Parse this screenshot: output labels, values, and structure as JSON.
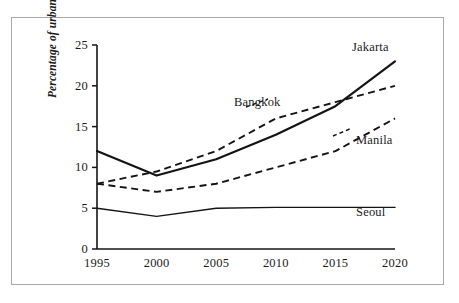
{
  "chart_data": {
    "type": "line",
    "title": "",
    "xlabel": "",
    "ylabel": "Percentage of urban income",
    "x": [
      1995,
      2000,
      2005,
      2010,
      2015,
      2020
    ],
    "categories": [
      "1995",
      "2000",
      "2005",
      "2010",
      "2015",
      "2020"
    ],
    "xlim": [
      1995,
      2020
    ],
    "ylim": [
      0,
      25
    ],
    "yticks": [
      0,
      5,
      10,
      15,
      20,
      25
    ],
    "ytick_labels": [
      "0",
      "5",
      "10",
      "15",
      "20",
      "25"
    ],
    "xticks": [
      1995,
      2000,
      2005,
      2010,
      2015,
      2020
    ],
    "xtick_labels": [
      "1995",
      "2000",
      "2005",
      "2010",
      "2015",
      "2020"
    ],
    "grid": false,
    "legend_position": "inline-labels",
    "series": [
      {
        "name": "Jakarta",
        "style": "solid",
        "width": 2.2,
        "color": "#141414",
        "values": [
          12.0,
          9.0,
          11.0,
          14.0,
          17.5,
          23.0
        ]
      },
      {
        "name": "Bangkok",
        "style": "dashed",
        "width": 1.9,
        "color": "#141414",
        "values": [
          8.0,
          9.5,
          12.0,
          16.0,
          18.0,
          20.0
        ]
      },
      {
        "name": "Manila",
        "style": "dashed",
        "width": 1.9,
        "color": "#141414",
        "values": [
          8.0,
          7.0,
          8.0,
          10.0,
          12.0,
          16.0
        ]
      },
      {
        "name": "Seoul",
        "style": "solid",
        "width": 1.4,
        "color": "#141414",
        "values": [
          5.0,
          4.0,
          5.0,
          5.1,
          5.1,
          5.1
        ]
      }
    ],
    "annotations": [
      {
        "text": "Jakarta",
        "series": "Jakarta"
      },
      {
        "text": "Bangkok",
        "series": "Bangkok"
      },
      {
        "text": "Manila",
        "series": "Manila"
      },
      {
        "text": "Seoul",
        "series": "Seoul"
      }
    ]
  },
  "axis": {
    "y_ticks": [
      "25",
      "20",
      "15",
      "10",
      "5",
      "0"
    ],
    "x_ticks": [
      "1995",
      "2000",
      "2005",
      "2010",
      "2015",
      "2020"
    ],
    "y_title": "Percentage of urban income"
  },
  "labels": {
    "jakarta": "Jakarta",
    "bangkok": "Bangkok",
    "manila": "Manila",
    "seoul": "Seoul"
  },
  "colors": {
    "frame": "#a8a8a8",
    "ink": "#141414",
    "background": "#ffffff"
  }
}
